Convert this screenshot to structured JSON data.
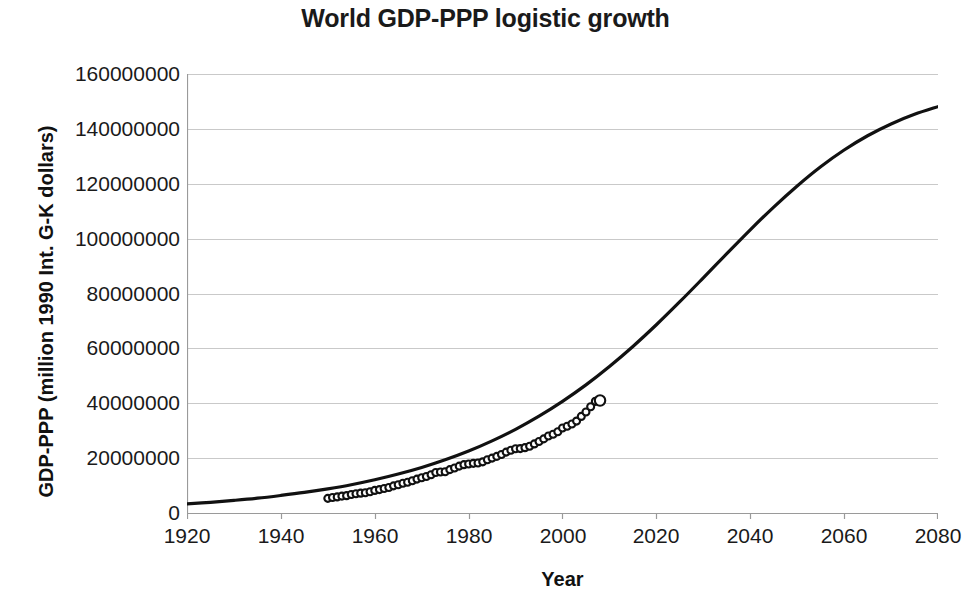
{
  "chart_data": {
    "type": "line",
    "title": "World GDP-PPP logistic growth",
    "xlabel": "Year",
    "ylabel": "GDP-PPP (million 1990 Int. G-K dollars)",
    "xlim": [
      1920,
      2080
    ],
    "ylim": [
      0,
      160000000
    ],
    "xticks": [
      1920,
      1940,
      1960,
      1980,
      2000,
      2020,
      2040,
      2060,
      2080
    ],
    "yticks": [
      0,
      20000000,
      40000000,
      60000000,
      80000000,
      100000000,
      120000000,
      140000000,
      160000000
    ],
    "ytick_labels": [
      "0",
      "20000000",
      "40000000",
      "60000000",
      "80000000",
      "100000000",
      "120000000",
      "140000000",
      "160000000"
    ],
    "xtick_labels": [
      "1920",
      "1940",
      "1960",
      "1980",
      "2000",
      "2020",
      "2040",
      "2060",
      "2080"
    ],
    "grid": "horizontal",
    "legend": null,
    "line_color": "#111111",
    "marker_color": "#111111",
    "series": [
      {
        "name": "Logistic fit",
        "style": "line",
        "x": [
          1920,
          1925,
          1930,
          1935,
          1940,
          1945,
          1950,
          1955,
          1960,
          1965,
          1970,
          1975,
          1980,
          1985,
          1990,
          1995,
          2000,
          2005,
          2010,
          2015,
          2020,
          2025,
          2030,
          2035,
          2040,
          2045,
          2050,
          2055,
          2060,
          2065,
          2070,
          2075,
          2080
        ],
        "y": [
          3300000,
          3900000,
          4600000,
          5400000,
          6400000,
          7500000,
          8800000,
          10300000,
          12100000,
          14200000,
          16600000,
          19400000,
          22600000,
          26300000,
          30500000,
          35300000,
          40700000,
          46700000,
          53400000,
          60700000,
          68600000,
          77000000,
          85700000,
          94500000,
          103200000,
          111500000,
          119200000,
          126200000,
          132300000,
          137500000,
          141800000,
          145300000,
          148100000
        ]
      },
      {
        "name": "Historical data",
        "style": "markers",
        "x": [
          1950,
          1951,
          1952,
          1953,
          1954,
          1955,
          1956,
          1957,
          1958,
          1959,
          1960,
          1961,
          1962,
          1963,
          1964,
          1965,
          1966,
          1967,
          1968,
          1969,
          1970,
          1971,
          1972,
          1973,
          1974,
          1975,
          1976,
          1977,
          1978,
          1979,
          1980,
          1981,
          1982,
          1983,
          1984,
          1985,
          1986,
          1987,
          1988,
          1989,
          1990,
          1991,
          1992,
          1993,
          1994,
          1995,
          1996,
          1997,
          1998,
          1999,
          2000,
          2001,
          2002,
          2003,
          2004,
          2005,
          2006,
          2007,
          2008
        ],
        "y": [
          5336000,
          5650000,
          5860000,
          6150000,
          6320000,
          6720000,
          7000000,
          7230000,
          7390000,
          7760000,
          8230000,
          8520000,
          8940000,
          9310000,
          9890000,
          10320000,
          10830000,
          11180000,
          11740000,
          12350000,
          12870000,
          13330000,
          13930000,
          14750000,
          14940000,
          15040000,
          15800000,
          16400000,
          17080000,
          17620000,
          17870000,
          18100000,
          18200000,
          18650000,
          19420000,
          20010000,
          20630000,
          21340000,
          22190000,
          22870000,
          23390000,
          23480000,
          23810000,
          24310000,
          25180000,
          26040000,
          27010000,
          28060000,
          28690000,
          29640000,
          31000000,
          31600000,
          32420000,
          33500000,
          35200000,
          36800000,
          38700000,
          40700000,
          41000000
        ]
      }
    ],
    "marker_shape": "open-circle"
  }
}
